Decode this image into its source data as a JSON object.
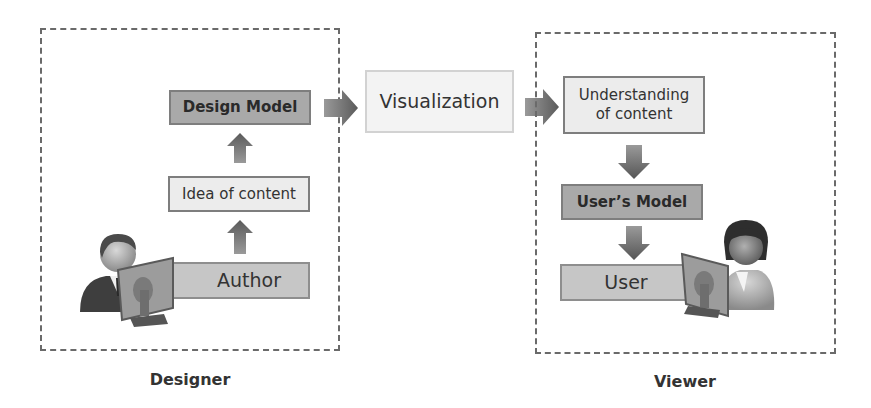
{
  "diagram": {
    "type": "process-flow",
    "designer": {
      "caption": "Designer",
      "boxes": {
        "design_model": "Design Model",
        "idea_of_content": "Idea of content",
        "author": "Author"
      }
    },
    "center": {
      "visualization": "Visualization"
    },
    "viewer": {
      "caption": "Viewer",
      "boxes": {
        "understanding_line1": "Understanding",
        "understanding_line2": "of content",
        "users_model": "User’s Model",
        "user": "User"
      }
    },
    "flow": [
      "Author → Idea of content",
      "Idea of content → Design Model",
      "Design Model → Visualization",
      "Visualization → Understanding of content",
      "Understanding of content → User’s Model",
      "User’s Model → User"
    ],
    "colors": {
      "dark_box": "#a9a9a9",
      "light_box": "#ececec",
      "mid_box": "#c6c6c6",
      "arrow": "#6e6e6e",
      "dash_border": "#6a6a6a"
    }
  }
}
